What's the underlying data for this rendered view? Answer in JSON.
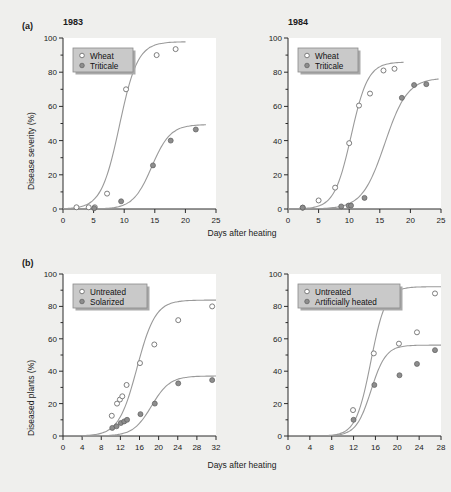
{
  "figure": {
    "background_color": "#efefed",
    "panels": [
      {
        "letter": "(a)",
        "ylabel": "Disease severity (%)",
        "xlabel": "Days after heating",
        "charts": [
          "a_left",
          "a_right"
        ]
      },
      {
        "letter": "(b)",
        "ylabel": "Diseased plants (%)",
        "xlabel": "Days after heating",
        "charts": [
          "b_left",
          "b_right"
        ]
      }
    ]
  },
  "chart_data": [
    {
      "id": "a_left",
      "type": "scatter",
      "title": "1983",
      "xlabel": "Days after heating",
      "ylabel": "Disease severity (%)",
      "xlim": [
        0,
        25
      ],
      "ylim": [
        0,
        100
      ],
      "xticks": [
        0,
        5,
        10,
        15,
        20,
        25
      ],
      "yticks": [
        0,
        20,
        40,
        60,
        80,
        100
      ],
      "grid": false,
      "legend_position": "top-left",
      "series": [
        {
          "name": "Wheat",
          "marker": "open-circle",
          "color": "#ffffff",
          "points": [
            {
              "x": 2.2,
              "y": 1.0
            },
            {
              "x": 4.2,
              "y": 1.0
            },
            {
              "x": 5.2,
              "y": 1.0
            },
            {
              "x": 7.2,
              "y": 9.0
            },
            {
              "x": 10.3,
              "y": 70.0
            },
            {
              "x": 15.3,
              "y": 90.0
            },
            {
              "x": 18.4,
              "y": 93.5
            }
          ]
        },
        {
          "name": "Triticale",
          "marker": "filled-circle",
          "color": "#8d8d8d",
          "points": [
            {
              "x": 5.1,
              "y": 0.5
            },
            {
              "x": 9.5,
              "y": 4.5
            },
            {
              "x": 14.7,
              "y": 25.5
            },
            {
              "x": 17.6,
              "y": 40.0
            },
            {
              "x": 21.7,
              "y": 46.5
            }
          ]
        }
      ]
    },
    {
      "id": "a_right",
      "type": "scatter",
      "title": "1984",
      "xlabel": "Days after heating",
      "ylabel": "Disease severity (%)",
      "xlim": [
        0,
        25
      ],
      "ylim": [
        0,
        100
      ],
      "xticks": [
        0,
        5,
        10,
        15,
        20,
        25
      ],
      "yticks": [
        0,
        20,
        40,
        60,
        80,
        100
      ],
      "grid": false,
      "legend_position": "top-left",
      "series": [
        {
          "name": "Wheat",
          "marker": "open-circle",
          "color": "#ffffff",
          "points": [
            {
              "x": 2.4,
              "y": 0.8
            },
            {
              "x": 5.0,
              "y": 5.0
            },
            {
              "x": 7.7,
              "y": 12.5
            },
            {
              "x": 10.0,
              "y": 38.5
            },
            {
              "x": 11.6,
              "y": 60.5
            },
            {
              "x": 13.4,
              "y": 67.5
            },
            {
              "x": 15.6,
              "y": 81.0
            },
            {
              "x": 17.4,
              "y": 82.0
            }
          ]
        },
        {
          "name": "Triticale",
          "marker": "filled-circle",
          "color": "#8d8d8d",
          "points": [
            {
              "x": 2.4,
              "y": 0.8
            },
            {
              "x": 8.7,
              "y": 1.5
            },
            {
              "x": 9.9,
              "y": 2.0
            },
            {
              "x": 10.3,
              "y": 2.0
            },
            {
              "x": 12.5,
              "y": 6.5
            },
            {
              "x": 18.6,
              "y": 65.0
            },
            {
              "x": 20.6,
              "y": 72.5
            },
            {
              "x": 22.6,
              "y": 73.0
            }
          ]
        }
      ]
    },
    {
      "id": "b_left",
      "type": "scatter",
      "title": "",
      "xlabel": "Days after heating",
      "ylabel": "Diseased plants (%)",
      "xlim": [
        0,
        32
      ],
      "ylim": [
        0,
        100
      ],
      "xticks": [
        0,
        4,
        8,
        12,
        16,
        20,
        24,
        28,
        32
      ],
      "yticks": [
        0,
        20,
        40,
        60,
        80,
        100
      ],
      "grid": false,
      "legend_position": "top-left",
      "series": [
        {
          "name": "Untreated",
          "marker": "open-circle",
          "color": "#ffffff",
          "points": [
            {
              "x": 10.2,
              "y": 12.5
            },
            {
              "x": 11.3,
              "y": 20.0
            },
            {
              "x": 11.9,
              "y": 22.5
            },
            {
              "x": 12.4,
              "y": 24.5
            },
            {
              "x": 13.3,
              "y": 31.5
            },
            {
              "x": 16.1,
              "y": 45.0
            },
            {
              "x": 19.1,
              "y": 56.5
            },
            {
              "x": 24.1,
              "y": 71.5
            },
            {
              "x": 31.2,
              "y": 80.0
            }
          ]
        },
        {
          "name": "Solarized",
          "marker": "filled-circle",
          "color": "#8d8d8d",
          "points": [
            {
              "x": 10.3,
              "y": 5.0
            },
            {
              "x": 11.2,
              "y": 6.0
            },
            {
              "x": 12.1,
              "y": 8.0
            },
            {
              "x": 12.8,
              "y": 9.0
            },
            {
              "x": 13.4,
              "y": 10.0
            },
            {
              "x": 16.2,
              "y": 13.5
            },
            {
              "x": 19.2,
              "y": 20.0
            },
            {
              "x": 24.1,
              "y": 32.5
            },
            {
              "x": 31.2,
              "y": 34.5
            }
          ]
        }
      ]
    },
    {
      "id": "b_right",
      "type": "scatter",
      "title": "",
      "xlabel": "Days after heating",
      "ylabel": "Diseased plants (%)",
      "xlim": [
        0,
        28
      ],
      "ylim": [
        0,
        100
      ],
      "xticks": [
        0,
        4,
        8,
        12,
        16,
        20,
        24,
        28
      ],
      "yticks": [
        0,
        20,
        40,
        60,
        80,
        100
      ],
      "grid": false,
      "legend_position": "top-left",
      "series": [
        {
          "name": "Untreated",
          "marker": "open-circle",
          "color": "#ffffff",
          "points": [
            {
              "x": 11.9,
              "y": 16.0
            },
            {
              "x": 15.7,
              "y": 51.0
            },
            {
              "x": 20.3,
              "y": 57.0
            },
            {
              "x": 23.6,
              "y": 64.0
            },
            {
              "x": 26.9,
              "y": 88.0
            }
          ]
        },
        {
          "name": "Artificially heated",
          "marker": "filled-circle",
          "color": "#8d8d8d",
          "points": [
            {
              "x": 12.0,
              "y": 10.0
            },
            {
              "x": 15.8,
              "y": 31.5
            },
            {
              "x": 20.4,
              "y": 37.5
            },
            {
              "x": 23.6,
              "y": 44.5
            },
            {
              "x": 26.9,
              "y": 53.0
            }
          ]
        }
      ]
    }
  ]
}
